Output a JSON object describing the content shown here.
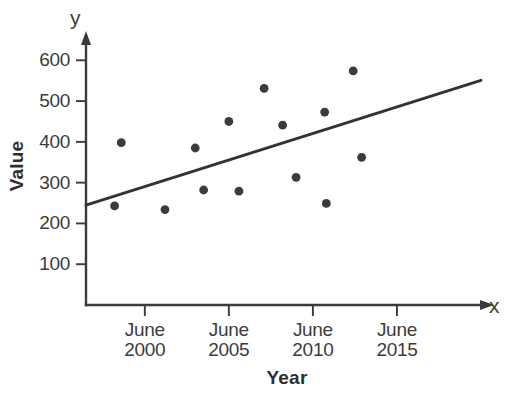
{
  "chart_data": {
    "type": "scatter",
    "title": "",
    "xlabel": "Year",
    "ylabel": "Value",
    "y_var_label": "y",
    "x_var_label": "x",
    "grid": false,
    "legend": "none",
    "xlim": [
      1996.5,
      2020.3
    ],
    "ylim": [
      0,
      640
    ],
    "y_ticks": [
      100,
      200,
      300,
      400,
      500,
      600
    ],
    "y_tick_labels": [
      "100",
      "200",
      "300",
      "400",
      "500",
      "600"
    ],
    "x_ticks": [
      2000,
      2005,
      2010,
      2015
    ],
    "x_tick_labels": [
      {
        "line1": "June",
        "line2": "2000"
      },
      {
        "line1": "June",
        "line2": "2005"
      },
      {
        "line1": "June",
        "line2": "2010"
      },
      {
        "line1": "June",
        "line2": "2015"
      }
    ],
    "points": [
      {
        "x": 1998.2,
        "y": 243
      },
      {
        "x": 1998.6,
        "y": 398
      },
      {
        "x": 2001.2,
        "y": 234
      },
      {
        "x": 2003.0,
        "y": 385
      },
      {
        "x": 2003.5,
        "y": 282
      },
      {
        "x": 2005.0,
        "y": 450
      },
      {
        "x": 2005.6,
        "y": 279
      },
      {
        "x": 2007.1,
        "y": 531
      },
      {
        "x": 2008.2,
        "y": 441
      },
      {
        "x": 2009.0,
        "y": 313
      },
      {
        "x": 2010.7,
        "y": 473
      },
      {
        "x": 2010.8,
        "y": 249
      },
      {
        "x": 2012.4,
        "y": 574
      },
      {
        "x": 2012.9,
        "y": 362
      }
    ],
    "trend_line": {
      "x_start": 1996.5,
      "y_start": 245,
      "x_end": 2020.0,
      "y_end": 551
    },
    "marker_radius": 4.4,
    "colors": {
      "point": "#3b3b3b",
      "trend": "#333333",
      "axis": "#3a3a3a",
      "text": "#3c3c3c",
      "background": "#ffffff"
    }
  }
}
